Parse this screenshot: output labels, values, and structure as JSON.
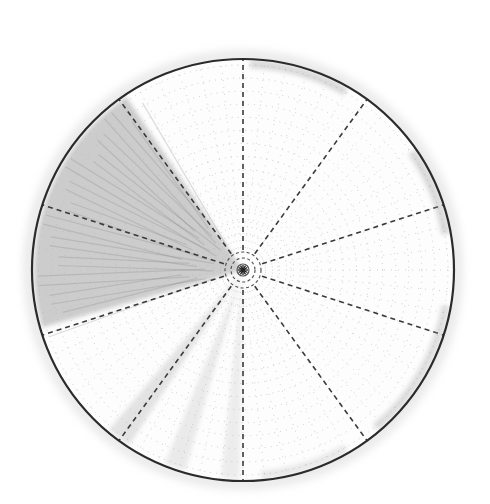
{
  "diagram": {
    "type": "polar-grid",
    "center": {
      "x": 243,
      "y": 270
    },
    "radius": 211,
    "radial_divisions": 10,
    "radial_angles_deg_from_top_clockwise": [
      0,
      36,
      72,
      108,
      144,
      180,
      216,
      252,
      288,
      324
    ],
    "concentric_dotted_rings": 14,
    "radial_dotted_spokes": 60,
    "center_rings": [
      6,
      12,
      18
    ],
    "colors": {
      "background": "#ffffff",
      "outline": "#2b2b2b",
      "dashed_divider": "#3a3a3a",
      "dotted_grid": "#b8b8b8",
      "shading_dark": "#8a8a8a",
      "shading_light": "#c9c9c9",
      "edge_smudge": "#9a9a9a"
    },
    "shaded_regions": [
      {
        "name": "dark-wedge",
        "start_deg": 254,
        "end_deg": 326,
        "opacity": 0.42
      },
      {
        "name": "streak-lower-left",
        "start_deg": 213,
        "end_deg": 220,
        "opacity": 0.22
      },
      {
        "name": "streak-lower",
        "start_deg": 196,
        "end_deg": 202,
        "opacity": 0.16
      },
      {
        "name": "streak-bottom",
        "start_deg": 181,
        "end_deg": 186,
        "opacity": 0.14
      }
    ],
    "edge_smudges": [
      {
        "start_deg": 2,
        "end_deg": 30,
        "opacity": 0.35
      },
      {
        "start_deg": 55,
        "end_deg": 80,
        "opacity": 0.35
      },
      {
        "start_deg": 100,
        "end_deg": 140,
        "opacity": 0.3
      },
      {
        "start_deg": 150,
        "end_deg": 175,
        "opacity": 0.2
      }
    ]
  }
}
